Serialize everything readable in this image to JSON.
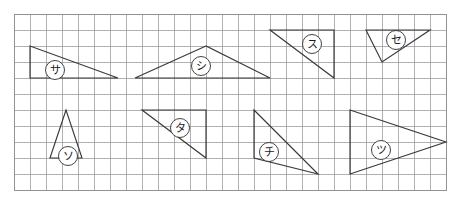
{
  "canvas": {
    "width": 467,
    "height": 205,
    "background": "#ffffff"
  },
  "grid": {
    "origin_x": 14,
    "origin_y": 14,
    "cell_size": 16,
    "columns": 27,
    "rows": 11,
    "line_color": "#8e8e96",
    "border_color": "#8e8e96",
    "show_border": "true"
  },
  "style": {
    "shape_stroke": "#3a3a3a",
    "label_circle_fill": "#ffffff",
    "label_circle_stroke": "#2e2e2e",
    "label_text_color": "#1a1a1a"
  },
  "shapes": [
    {
      "id": "triangle-sa",
      "label": "サ",
      "label_romaji": "sa",
      "points": "30,46 30,78 118,78",
      "label_x": 55,
      "label_y": 70,
      "label_r": 9.5
    },
    {
      "id": "triangle-shi",
      "label": "シ",
      "label_romaji": "shi",
      "points": "206,46 135,78 270,78",
      "label_x": 201,
      "label_y": 66,
      "label_r": 9.5
    },
    {
      "id": "triangle-su",
      "label": "ス",
      "label_romaji": "su",
      "points": "270,30 334,30 334,78",
      "label_x": 312,
      "label_y": 44,
      "label_r": 9.5
    },
    {
      "id": "triangle-se",
      "label": "セ",
      "label_romaji": "se",
      "points": "366,30 430,30 382,62",
      "label_x": 396,
      "label_y": 40,
      "label_r": 9.5
    },
    {
      "id": "triangle-so",
      "label": "ソ",
      "label_romaji": "so",
      "points": "66,110 50,158 82,158",
      "label_x": 68,
      "label_y": 156,
      "label_r": 9.5
    },
    {
      "id": "triangle-ta",
      "label": "タ",
      "label_romaji": "ta",
      "points": "142,110 206,110 206,158",
      "label_x": 180,
      "label_y": 128,
      "label_r": 9.5
    },
    {
      "id": "triangle-chi",
      "label": "チ",
      "label_romaji": "chi",
      "points": "254,110 254,158 318,174",
      "label_x": 269,
      "label_y": 152,
      "label_r": 9.5
    },
    {
      "id": "triangle-tsu",
      "label": "ツ",
      "label_romaji": "tsu",
      "points": "350,110 350,174 446,142",
      "label_x": 381,
      "label_y": 150,
      "label_r": 9.5
    }
  ]
}
